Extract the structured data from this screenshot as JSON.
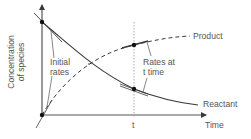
{
  "diagram": {
    "axes": {
      "y_label_line1": "Concentration",
      "y_label_line2": "of species",
      "x_label": "Time",
      "x_tick": "t"
    },
    "curves": {
      "product_label": "Product",
      "reactant_label": "Reactant"
    },
    "annotations": {
      "initial_rates_line1": "Initial",
      "initial_rates_line2": "rates",
      "rates_at_t_line1": "Rates at",
      "rates_at_t_line2": "t time"
    },
    "colors": {
      "curve": "#3a3a3a",
      "axis": "#3a3a3a",
      "guide": "#888888",
      "text": "#555555",
      "point": "#111111"
    }
  }
}
